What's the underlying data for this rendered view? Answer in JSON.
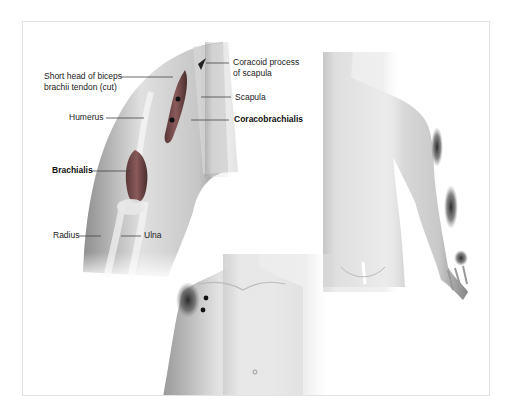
{
  "figure": {
    "panels": [
      {
        "id": "upper-arm-anatomy",
        "description": "Anterior view of right shoulder and upper arm showing coracobrachialis muscle",
        "labels": {
          "coracoid_line1": "Coracoid process",
          "coracoid_line2": "of scapula",
          "scapula": "Scapula",
          "coracobrachialis": "Coracobrachialis",
          "biceps_line1": "Short head of biceps",
          "biceps_line2": "brachii tendon (cut)",
          "humerus": "Humerus",
          "brachialis": "Brachialis",
          "radius": "Radius",
          "ulna": "Ulna"
        },
        "trigger_points": 2
      },
      {
        "id": "posterior-referral-pattern",
        "description": "Posterior view of torso and right arm showing pain referral zones along back of arm, forearm and hand",
        "referral_zones": 3
      },
      {
        "id": "anterior-referral-pattern",
        "description": "Anterior view of torso showing pain referral zone over front of shoulder",
        "trigger_points": 2,
        "referral_zones": 1
      }
    ],
    "colors": {
      "frame_border": "#e3e3e3",
      "label_text": "#222222",
      "leader_line": "#444444",
      "muscle": "#7a4a4a",
      "trigger_point": "#111111",
      "skin_shade": "#bdbdbd"
    }
  }
}
